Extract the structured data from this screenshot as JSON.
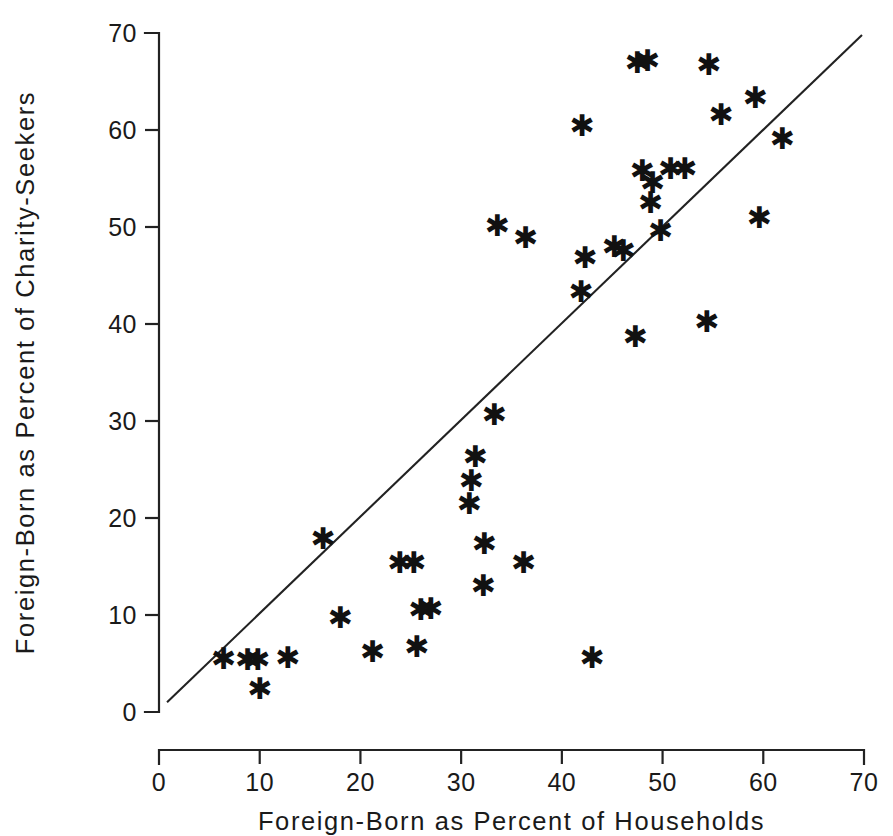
{
  "chart_data": {
    "type": "scatter",
    "title": "",
    "xlabel": "Foreign-Born as Percent of Households",
    "ylabel": "Foreign-Born as Percent of Charity-Seekers",
    "xlim": [
      0,
      70
    ],
    "ylim": [
      0,
      70
    ],
    "xticks": [
      0,
      10,
      20,
      30,
      40,
      50,
      60,
      70
    ],
    "yticks": [
      0,
      10,
      20,
      30,
      40,
      50,
      60,
      70
    ],
    "xticklabels": [
      "0",
      "10",
      "20",
      "30",
      "40",
      "50",
      "60",
      "70"
    ],
    "yticklabels": [
      "0",
      "10",
      "20",
      "30",
      "40",
      "50",
      "60",
      "70"
    ],
    "grid": false,
    "legend": false,
    "marker": "asterisk",
    "marker_color": "#111111",
    "reference_line": {
      "label": "diagonal reference line",
      "x_start": 0.8,
      "y_start": 1.0,
      "x_end": 69.8,
      "y_end": 69.8
    },
    "points": [
      {
        "x": 6.4,
        "y": 5.5
      },
      {
        "x": 8.8,
        "y": 5.4
      },
      {
        "x": 9.8,
        "y": 5.4
      },
      {
        "x": 10.0,
        "y": 2.4
      },
      {
        "x": 12.8,
        "y": 5.6
      },
      {
        "x": 16.3,
        "y": 17.9
      },
      {
        "x": 18.0,
        "y": 9.7
      },
      {
        "x": 21.2,
        "y": 6.2
      },
      {
        "x": 23.9,
        "y": 15.4
      },
      {
        "x": 25.3,
        "y": 15.4
      },
      {
        "x": 25.6,
        "y": 6.8
      },
      {
        "x": 26.0,
        "y": 10.6
      },
      {
        "x": 27.0,
        "y": 10.7
      },
      {
        "x": 30.8,
        "y": 21.5
      },
      {
        "x": 31.0,
        "y": 23.9
      },
      {
        "x": 31.4,
        "y": 26.3
      },
      {
        "x": 32.2,
        "y": 13.0
      },
      {
        "x": 32.3,
        "y": 17.4
      },
      {
        "x": 33.3,
        "y": 30.7
      },
      {
        "x": 33.6,
        "y": 50.2
      },
      {
        "x": 36.2,
        "y": 15.4
      },
      {
        "x": 36.4,
        "y": 48.9
      },
      {
        "x": 41.9,
        "y": 43.4
      },
      {
        "x": 42.0,
        "y": 60.5
      },
      {
        "x": 42.3,
        "y": 46.9
      },
      {
        "x": 43.0,
        "y": 5.6
      },
      {
        "x": 45.2,
        "y": 48.0
      },
      {
        "x": 46.1,
        "y": 47.6
      },
      {
        "x": 47.3,
        "y": 38.7
      },
      {
        "x": 47.5,
        "y": 67.0
      },
      {
        "x": 48.0,
        "y": 55.8
      },
      {
        "x": 48.5,
        "y": 67.2
      },
      {
        "x": 48.8,
        "y": 52.5
      },
      {
        "x": 49.0,
        "y": 54.6
      },
      {
        "x": 49.8,
        "y": 49.6
      },
      {
        "x": 50.8,
        "y": 56.0
      },
      {
        "x": 52.2,
        "y": 56.0
      },
      {
        "x": 54.4,
        "y": 40.3
      },
      {
        "x": 54.6,
        "y": 66.8
      },
      {
        "x": 55.8,
        "y": 61.6
      },
      {
        "x": 59.2,
        "y": 63.4
      },
      {
        "x": 59.6,
        "y": 51.0
      },
      {
        "x": 61.9,
        "y": 59.1
      }
    ]
  }
}
